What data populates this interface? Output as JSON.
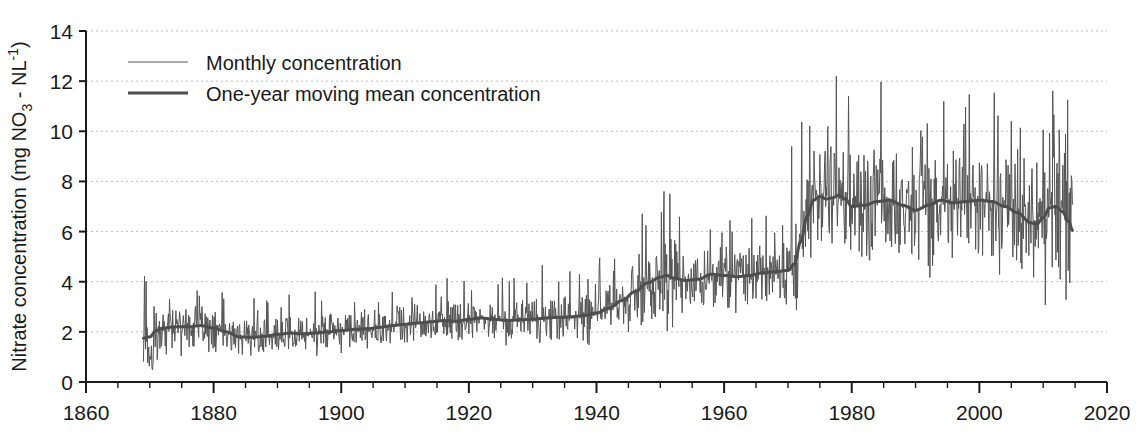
{
  "chart_data": {
    "type": "line",
    "title": "",
    "xlabel": "",
    "ylabel": "Nitrate concentration (mg NO3 - NL-1)",
    "ylabel_parts": {
      "pre": "Nitrate concentration (mg NO",
      "sub": "3",
      "mid": " - NL",
      "sup": "-1",
      "post": ")"
    },
    "xlim": [
      1860,
      2020
    ],
    "ylim": [
      0,
      14
    ],
    "x_ticks": [
      1860,
      1880,
      1900,
      1920,
      1940,
      1960,
      1980,
      2000,
      2020
    ],
    "x_tick_labels": [
      "1860",
      "1880",
      "1900",
      "1920",
      "1940",
      "1960",
      "1980",
      "2000",
      "2020"
    ],
    "x_minor_step": 5,
    "y_ticks": [
      0,
      2,
      4,
      6,
      8,
      10,
      12,
      14
    ],
    "y_tick_labels": [
      "0",
      "2",
      "4",
      "6",
      "8",
      "10",
      "12",
      "14"
    ],
    "grid": {
      "horizontal": true,
      "vertical": false,
      "style": "dotted",
      "color": "#bdbdbd"
    },
    "legend": {
      "position": "top-left-inside",
      "entries": [
        {
          "label": "Monthly concentration",
          "color": "#555555",
          "width": 1.0
        },
        {
          "label": "One-year moving mean concentration",
          "color": "#4d4d4d",
          "width": 3.0
        }
      ]
    },
    "data_start_year": 1869,
    "data_end_year": 2014.6,
    "series": [
      {
        "name": "Monthly concentration",
        "note": "monthly samples, high-frequency noise around the moving mean; amplitude grows sharply after 1970",
        "color": "#555555",
        "max_value": 12.2,
        "max_value_year": 1977.6,
        "min_value": 0.3,
        "min_value_year": 1869.9
      },
      {
        "name": "One-year moving mean concentration",
        "color": "#4d4d4d",
        "anchors": [
          [
            1869.0,
            1.75
          ],
          [
            1870.0,
            1.8
          ],
          [
            1871.0,
            2.05
          ],
          [
            1872.0,
            2.15
          ],
          [
            1874.0,
            2.2
          ],
          [
            1876.0,
            2.2
          ],
          [
            1878.0,
            2.25
          ],
          [
            1880.0,
            2.15
          ],
          [
            1882.0,
            2.0
          ],
          [
            1884.0,
            1.8
          ],
          [
            1886.0,
            1.78
          ],
          [
            1888.0,
            1.82
          ],
          [
            1890.0,
            1.9
          ],
          [
            1892.0,
            1.95
          ],
          [
            1894.0,
            1.92
          ],
          [
            1896.0,
            1.95
          ],
          [
            1898.0,
            2.0
          ],
          [
            1900.0,
            2.05
          ],
          [
            1902.0,
            2.1
          ],
          [
            1904.0,
            2.12
          ],
          [
            1906.0,
            2.18
          ],
          [
            1908.0,
            2.25
          ],
          [
            1910.0,
            2.3
          ],
          [
            1912.0,
            2.35
          ],
          [
            1914.0,
            2.4
          ],
          [
            1916.0,
            2.45
          ],
          [
            1918.0,
            2.42
          ],
          [
            1920.0,
            2.5
          ],
          [
            1922.0,
            2.55
          ],
          [
            1924.0,
            2.5
          ],
          [
            1926.0,
            2.45
          ],
          [
            1928.0,
            2.48
          ],
          [
            1930.0,
            2.5
          ],
          [
            1932.0,
            2.55
          ],
          [
            1934.0,
            2.58
          ],
          [
            1936.0,
            2.6
          ],
          [
            1938.0,
            2.65
          ],
          [
            1940.0,
            2.75
          ],
          [
            1942.0,
            2.95
          ],
          [
            1944.0,
            3.25
          ],
          [
            1946.0,
            3.6
          ],
          [
            1948.0,
            3.95
          ],
          [
            1950.0,
            4.18
          ],
          [
            1951.0,
            4.25
          ],
          [
            1952.0,
            4.15
          ],
          [
            1954.0,
            4.05
          ],
          [
            1956.0,
            4.1
          ],
          [
            1958.0,
            4.3
          ],
          [
            1960.0,
            4.25
          ],
          [
            1962.0,
            4.2
          ],
          [
            1964.0,
            4.25
          ],
          [
            1966.0,
            4.35
          ],
          [
            1968.0,
            4.4
          ],
          [
            1970.0,
            4.45
          ],
          [
            1971.0,
            4.7
          ],
          [
            1972.0,
            5.6
          ],
          [
            1973.0,
            6.6
          ],
          [
            1974.0,
            7.25
          ],
          [
            1975.0,
            7.4
          ],
          [
            1976.0,
            7.3
          ],
          [
            1977.0,
            7.35
          ],
          [
            1978.0,
            7.45
          ],
          [
            1979.0,
            7.3
          ],
          [
            1980.0,
            7.0
          ],
          [
            1982.0,
            7.05
          ],
          [
            1984.0,
            7.2
          ],
          [
            1986.0,
            7.25
          ],
          [
            1988.0,
            7.05
          ],
          [
            1990.0,
            6.85
          ],
          [
            1992.0,
            7.05
          ],
          [
            1994.0,
            7.25
          ],
          [
            1996.0,
            7.15
          ],
          [
            1998.0,
            7.2
          ],
          [
            2000.0,
            7.25
          ],
          [
            2002.0,
            7.2
          ],
          [
            2004.0,
            7.0
          ],
          [
            2006.0,
            6.75
          ],
          [
            2008.0,
            6.35
          ],
          [
            2009.0,
            6.3
          ],
          [
            2010.0,
            6.55
          ],
          [
            2011.0,
            6.95
          ],
          [
            2012.0,
            7.0
          ],
          [
            2013.0,
            6.8
          ],
          [
            2014.0,
            6.4
          ],
          [
            2014.6,
            6.05
          ]
        ]
      }
    ]
  },
  "axis_geometry": {
    "left_px": 86,
    "right_px": 1107,
    "top_px": 31,
    "bottom_px": 382
  }
}
